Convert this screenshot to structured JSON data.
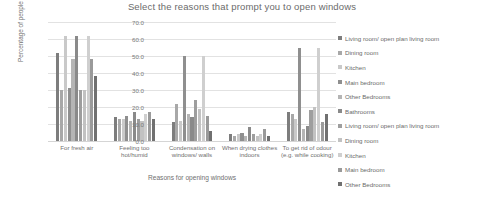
{
  "chart_data": {
    "type": "bar",
    "title": "Select the reasons that prompt you to open windows",
    "xlabel": "Reasons for opening windows",
    "ylabel": "Percentage of people",
    "ylim": [
      0,
      70
    ],
    "ytick_step": 10,
    "ytick_labels": [
      "70.0",
      "60.0",
      "50.0",
      "40.0",
      "30.0",
      "20.0",
      "10.0",
      "0.0"
    ],
    "grid": true,
    "legend_position": "right",
    "categories": [
      "For fresh air",
      "Feeling too hot/humid",
      "Condensation on windows/ walls",
      "When drying clothes indoors",
      "To get rid of odour (e.g. while cooking)"
    ],
    "series": [
      {
        "name": "Living room/ open plan living room",
        "color": "#7d7d7d",
        "values": [
          52,
          14,
          11,
          4,
          17
        ]
      },
      {
        "name": "Dining room",
        "color": "#a8a8a8",
        "values": [
          30,
          13,
          22,
          3,
          16
        ]
      },
      {
        "name": "Kitchen",
        "color": "#c9c9c9",
        "values": [
          62,
          13,
          12,
          4,
          13
        ]
      },
      {
        "name": "Main bedroom",
        "color": "#8f8f8f",
        "values": [
          31,
          15,
          50,
          5,
          55
        ]
      },
      {
        "name": "Other Bedrooms",
        "color": "#b5b5b5",
        "values": [
          48,
          12,
          16,
          3,
          7
        ]
      },
      {
        "name": "Bathrooms",
        "color": "#8a8a8a",
        "values": [
          62,
          17,
          14,
          8,
          9
        ]
      },
      {
        "name": "Living room/ open plan living room",
        "color": "#9e9e9e",
        "values": [
          30,
          13,
          24,
          4,
          18
        ]
      },
      {
        "name": "Dining room",
        "color": "#c2c2c2",
        "values": [
          30,
          12,
          19,
          3,
          20
        ]
      },
      {
        "name": "Kitchen",
        "color": "#cfcfcf",
        "values": [
          62,
          16,
          50,
          4,
          55
        ]
      },
      {
        "name": "Main bedroom",
        "color": "#9a9a9a",
        "values": [
          48,
          17,
          15,
          7,
          11
        ]
      },
      {
        "name": "Other Bedrooms",
        "color": "#707070",
        "values": [
          38,
          13,
          6,
          3,
          16
        ]
      }
    ]
  }
}
